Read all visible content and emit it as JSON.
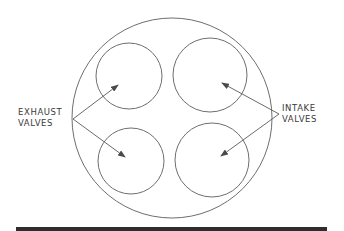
{
  "diagram": {
    "labels": {
      "exhaust": {
        "line1": "EXHAUST",
        "line2": "VALVES"
      },
      "intake": {
        "line1": "INTAKE",
        "line2": "VALVES"
      }
    },
    "colors": {
      "stroke": "#6e6e6e",
      "text": "#3a3a3a",
      "rule": "#2e2e2e",
      "background": "#ffffff"
    },
    "shapes": {
      "cylinder_bore": {
        "cx": 172,
        "cy": 118,
        "r": 100
      },
      "valves": [
        {
          "id": "exhaust-top",
          "type": "exhaust",
          "cx": 129,
          "cy": 76,
          "r": 33
        },
        {
          "id": "exhaust-bottom",
          "type": "exhaust",
          "cx": 131,
          "cy": 161,
          "r": 33
        },
        {
          "id": "intake-top",
          "type": "intake",
          "cx": 210,
          "cy": 75,
          "r": 37
        },
        {
          "id": "intake-bottom",
          "type": "intake",
          "cx": 212,
          "cy": 160,
          "r": 37
        }
      ],
      "arrows": [
        {
          "from": [
            73,
            119
          ],
          "to": [
            118,
            85
          ],
          "target": "exhaust-top"
        },
        {
          "from": [
            73,
            119
          ],
          "to": [
            125,
            157
          ],
          "target": "exhaust-bottom"
        },
        {
          "from": [
            279,
            114
          ],
          "to": [
            222,
            83
          ],
          "target": "intake-top"
        },
        {
          "from": [
            279,
            114
          ],
          "to": [
            221,
            156
          ],
          "target": "intake-bottom"
        }
      ]
    }
  }
}
